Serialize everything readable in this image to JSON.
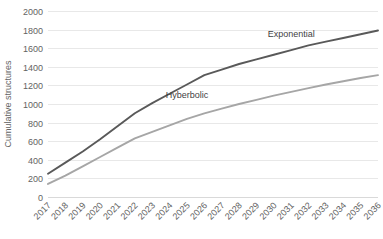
{
  "chart_data": {
    "type": "line",
    "title": "",
    "xlabel": "",
    "ylabel": "Cumulative structures",
    "ylim": [
      0,
      2000
    ],
    "yticks": [
      0,
      200,
      400,
      600,
      800,
      1000,
      1200,
      1400,
      1600,
      1800,
      2000
    ],
    "ytick_labels": [
      "0",
      "200",
      "400",
      "600",
      "800",
      "1000",
      "1200",
      "1400",
      "1600",
      "1800",
      "2000"
    ],
    "grid": true,
    "legend_position": "inline-labels",
    "x": [
      2017,
      2018,
      2019,
      2020,
      2021,
      2022,
      2023,
      2024,
      2025,
      2026,
      2027,
      2028,
      2029,
      2030,
      2031,
      2032,
      2033,
      2034,
      2035,
      2036
    ],
    "categories": [
      "2017",
      "2018",
      "2019",
      "2020",
      "2021",
      "2022",
      "2023",
      "2024",
      "2025",
      "2026",
      "2027",
      "2028",
      "2029",
      "2030",
      "2031",
      "2032",
      "2033",
      "2034",
      "2035",
      "2036"
    ],
    "series": [
      {
        "name": "Exponential",
        "color": "#595959",
        "label_x": 2031,
        "label_y": 1720,
        "values": [
          250,
          370,
          490,
          620,
          760,
          900,
          1010,
          1110,
          1210,
          1310,
          1370,
          1430,
          1480,
          1530,
          1580,
          1630,
          1670,
          1710,
          1750,
          1790
        ]
      },
      {
        "name": "Hyberbolic",
        "color": "#a6a6a6",
        "label_x": 2025,
        "label_y": 1065,
        "values": [
          140,
          230,
          330,
          430,
          530,
          630,
          700,
          770,
          840,
          900,
          950,
          1000,
          1045,
          1090,
          1130,
          1170,
          1210,
          1245,
          1280,
          1310
        ]
      }
    ]
  },
  "axes": {
    "y_title": "Cumulative structures"
  }
}
